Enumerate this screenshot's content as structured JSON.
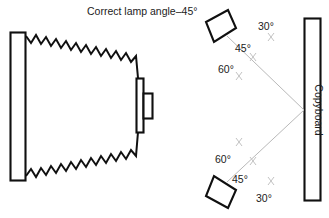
{
  "figure": {
    "title": "Correct lamp angle–45°",
    "background_color": "#ffffff",
    "ink_color": "#101010",
    "beam_color": "#b9b9b9"
  },
  "left_panel": {
    "name": "lamp-beam-spread-view",
    "board_label": "",
    "lamp_label": "",
    "description_visible": false
  },
  "right_panel": {
    "copyboard_label": "Copyboard",
    "top_lamp": {
      "angles": [
        {
          "value": "30°",
          "id": "top-30"
        },
        {
          "value": "45°",
          "id": "top-45"
        },
        {
          "value": "60°",
          "id": "top-60"
        }
      ]
    },
    "bottom_lamp": {
      "angles": [
        {
          "value": "60°",
          "id": "bottom-60"
        },
        {
          "value": "45°",
          "id": "bottom-45"
        },
        {
          "value": "30°",
          "id": "bottom-30"
        }
      ]
    }
  }
}
